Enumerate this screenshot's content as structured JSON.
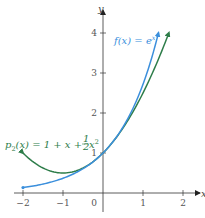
{
  "chart_data": {
    "type": "line",
    "title": "",
    "xlabel": "x",
    "ylabel": "y",
    "xlim": [
      -2.2,
      2.4
    ],
    "ylim": [
      -0.3,
      4.3
    ],
    "grid": false,
    "x_ticks": [
      -2,
      -1,
      0,
      1,
      2
    ],
    "x_tick_labels": [
      "−2",
      "−1",
      "0",
      "1",
      "2"
    ],
    "y_ticks": [
      1,
      2,
      3,
      4
    ],
    "y_tick_labels": [
      "1",
      "2",
      "3",
      "4"
    ],
    "series": [
      {
        "name": "f(x) = e^x",
        "color": "#3b8fdc",
        "domain": [
          -2,
          1.386
        ],
        "x": [
          -2,
          -1.5,
          -1,
          -0.5,
          0,
          0.5,
          1,
          1.386
        ],
        "values": [
          0.135,
          0.223,
          0.368,
          0.607,
          1.0,
          1.649,
          2.718,
          4.0
        ]
      },
      {
        "name": "p2(x) = 1 + x + (1/2)x^2",
        "color": "#2e7d4a",
        "domain": [
          -2,
          1.646
        ],
        "x": [
          -2,
          -1.5,
          -1,
          -0.5,
          0,
          0.5,
          1,
          1.5,
          1.646
        ],
        "values": [
          1.0,
          0.625,
          0.5,
          0.625,
          1.0,
          1.625,
          2.5,
          3.625,
          4.0
        ]
      }
    ],
    "annotations": [
      {
        "text_main": "f(x) = e",
        "text_sup": "x",
        "color": "#3b8fdc"
      },
      {
        "text_main": "p",
        "text_sub": "2",
        "text_rest": "(x) = 1 + x + ",
        "frac_num": "1",
        "frac_den": "2",
        "text_tail": "x",
        "text_sup": "2",
        "color": "#2e7d4a"
      }
    ]
  }
}
